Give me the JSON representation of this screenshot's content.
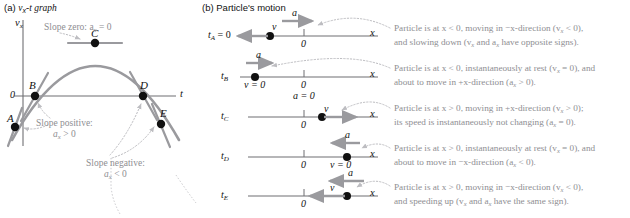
{
  "panels": {
    "a": {
      "tag": "(a)",
      "title_pre": "v",
      "title_sub": "x",
      "title_post": "-t graph"
    },
    "b": {
      "tag": "(b)",
      "title": "Particle's motion"
    }
  },
  "graph": {
    "y_axis_label": "v",
    "y_axis_sub": "x",
    "x_axis_label": "t",
    "origin_label": "0",
    "points": [
      {
        "name": "A",
        "label": "A"
      },
      {
        "name": "B",
        "label": "B"
      },
      {
        "name": "C",
        "label": "C"
      },
      {
        "name": "D",
        "label": "D"
      },
      {
        "name": "E",
        "label": "E"
      }
    ],
    "annotations": [
      {
        "name": "slope-zero",
        "line1": "Slope zero: a",
        "sub": "x",
        "line1_end": " = 0"
      },
      {
        "name": "slope-positive",
        "line1": "Slope positive:",
        "line2_pre": "a",
        "sub": "x",
        "line2_post": " > 0"
      },
      {
        "name": "slope-negative",
        "line1": "Slope negative:",
        "line2_pre": "a",
        "sub": "x",
        "line2_post": " < 0"
      }
    ]
  },
  "motion_rows": [
    {
      "id": "A",
      "time_label": "t",
      "time_sub": "A",
      "time_eq": " = 0",
      "axis_label": "x",
      "origin_label": "0",
      "v_label": "v",
      "a_label": "a",
      "v_dir": "left",
      "a_dir": "right",
      "v_zero": false,
      "a_zero": false,
      "desc_line1": "Particle is at x < 0, moving in −x-direction (v",
      "desc_line1_sub": "x",
      "desc_line1_end": " < 0),",
      "desc_line2": "and slowing down (v",
      "desc_line2_sub": "x",
      "desc_line2_mid": " and a",
      "desc_line2_sub2": "x",
      "desc_line2_end": " have opposite signs)."
    },
    {
      "id": "B",
      "time_label": "t",
      "time_sub": "B",
      "time_eq": "",
      "axis_label": "x",
      "origin_label": "0",
      "v_label": "v = 0",
      "a_label": "a",
      "v_dir": "none",
      "a_dir": "right",
      "v_zero": true,
      "a_zero": false,
      "desc_line1": "Particle is at x < 0, instantaneously at rest (v",
      "desc_line1_sub": "x",
      "desc_line1_end": " = 0), and",
      "desc_line2": "about to move in +x-direction (a",
      "desc_line2_sub": "x",
      "desc_line2_mid": "",
      "desc_line2_sub2": "",
      "desc_line2_end": " > 0)."
    },
    {
      "id": "C",
      "time_label": "t",
      "time_sub": "C",
      "time_eq": "",
      "axis_label": "x",
      "origin_label": "0",
      "v_label": "v",
      "a_label": "a = 0",
      "v_dir": "right",
      "a_dir": "none",
      "v_zero": false,
      "a_zero": true,
      "desc_line1": "Particle is at x > 0, moving in +x-direction (v",
      "desc_line1_sub": "x",
      "desc_line1_end": " > 0);",
      "desc_line2": "its speed is instantaneously not changing (a",
      "desc_line2_sub": "x",
      "desc_line2_mid": "",
      "desc_line2_sub2": "",
      "desc_line2_end": " = 0)."
    },
    {
      "id": "D",
      "time_label": "t",
      "time_sub": "D",
      "time_eq": "",
      "axis_label": "x",
      "origin_label": "0",
      "v_label": "v = 0",
      "a_label": "a",
      "v_dir": "none",
      "a_dir": "left",
      "v_zero": true,
      "a_zero": false,
      "desc_line1": "Particle is at x > 0, instantaneously at rest (v",
      "desc_line1_sub": "x",
      "desc_line1_end": " = 0), and",
      "desc_line2": "about to move in −x-direction (a",
      "desc_line2_sub": "x",
      "desc_line2_mid": "",
      "desc_line2_sub2": "",
      "desc_line2_end": " < 0)."
    },
    {
      "id": "E",
      "time_label": "t",
      "time_sub": "E",
      "time_eq": "",
      "axis_label": "x",
      "origin_label": "0",
      "v_label": "v",
      "a_label": "a",
      "v_dir": "left",
      "a_dir": "left",
      "v_zero": false,
      "a_zero": false,
      "desc_line1": "Particle is at x > 0, moving in −x-direction (v",
      "desc_line1_sub": "x",
      "desc_line1_end": " < 0),",
      "desc_line2": "and speeding up (v",
      "desc_line2_sub": "x",
      "desc_line2_mid": " and a",
      "desc_line2_sub2": "x",
      "desc_line2_end": " have the same sign)."
    }
  ],
  "colors": {
    "curve": "#9a9a9e",
    "axis": "#6f6f73",
    "point": "#111111",
    "note_text": "#8e8e92",
    "arrow": "#8e8e92",
    "dotted": "#b4b4b8"
  }
}
